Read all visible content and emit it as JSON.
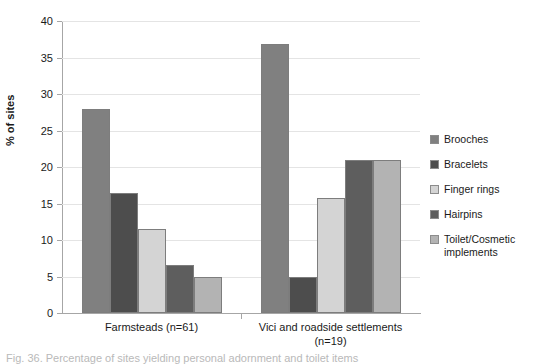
{
  "chart_data": {
    "type": "bar",
    "title": "",
    "xlabel": "",
    "ylabel": "% of sites",
    "ylim": [
      0,
      40
    ],
    "yticks": [
      0,
      5,
      10,
      15,
      20,
      25,
      30,
      35,
      40
    ],
    "grid": true,
    "legend_position": "right",
    "categories": [
      "Farmsteads (n=61)",
      "Vici and roadside settlements (n=19)"
    ],
    "series": [
      {
        "name": "Brooches",
        "values": [
          27.9,
          36.8
        ],
        "color": "#808080"
      },
      {
        "name": "Bracelets",
        "values": [
          16.4,
          5.0
        ],
        "color": "#4d4d4d"
      },
      {
        "name": "Finger rings",
        "values": [
          11.5,
          15.7
        ],
        "color": "#d4d4d4"
      },
      {
        "name": "Hairpins",
        "values": [
          6.6,
          21.0
        ],
        "color": "#5e5e5e"
      },
      {
        "name": "Toilet/Cosmetic implements",
        "values": [
          4.9,
          21.0
        ],
        "color": "#b3b3b3"
      }
    ]
  },
  "axis": {
    "y_label": "% of sites",
    "y_tick_labels": [
      "0",
      "5",
      "10",
      "15",
      "20",
      "25",
      "30",
      "35",
      "40"
    ]
  },
  "categories": [
    {
      "label": "Farmsteads (n=61)",
      "line1": "Farmsteads (n=61)",
      "line2": ""
    },
    {
      "label": "Vici and roadside settlements (n=19)",
      "line1": "Vici and roadside settlements",
      "line2": "(n=19)"
    }
  ],
  "legend": {
    "items": [
      {
        "label": "Brooches",
        "color": "#808080"
      },
      {
        "label": "Bracelets",
        "color": "#4d4d4d"
      },
      {
        "label": "Finger rings",
        "color": "#d4d4d4"
      },
      {
        "label": "Hairpins",
        "color": "#5e5e5e"
      },
      {
        "label": "Toilet/Cosmetic implements",
        "color": "#b3b3b3"
      }
    ]
  },
  "caption": {
    "text": "Fig. 36. Percentage of sites yielding personal adornment and toilet items"
  }
}
